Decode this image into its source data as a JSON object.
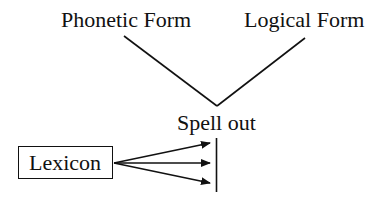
{
  "diagram": {
    "type": "linguistic-architecture",
    "nodes": {
      "phonetic_form": "Phonetic Form",
      "logical_form": "Logical Form",
      "spell_out": "Spell out",
      "lexicon": "Lexicon"
    },
    "edges": [
      {
        "from": "spell_out",
        "to": "phonetic_form",
        "style": "line"
      },
      {
        "from": "spell_out",
        "to": "logical_form",
        "style": "line"
      },
      {
        "from": "lexicon",
        "to": "derivation_line",
        "style": "arrow",
        "count": 3
      }
    ],
    "colors": {
      "ink": "#111111",
      "background": "#ffffff"
    }
  }
}
